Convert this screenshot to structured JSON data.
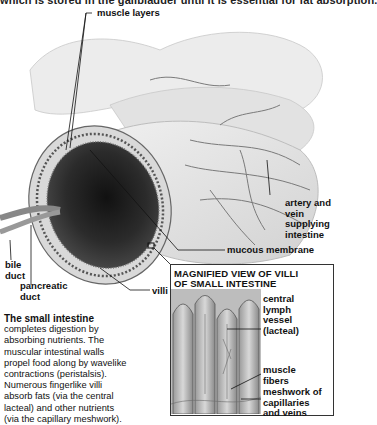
{
  "top_text": "which is stored in the gallbladder until it is essential for fat absorption.",
  "labels": {
    "muscle_layers": "muscle layers",
    "artery_vein": [
      "artery and",
      "vein",
      "supplying",
      "intestine"
    ],
    "mucous_membrane": "mucous membrane",
    "bile_duct": [
      "bile",
      "duct"
    ],
    "pancreatic_duct": [
      "pancreatic",
      "duct"
    ],
    "villi": "villi"
  },
  "inset": {
    "title_line1": "MAGNIFIED VIEW OF VILLI",
    "title_line2": "OF SMALL INTESTINE",
    "labels": {
      "lacteal": [
        "central",
        "lymph",
        "vessel",
        "(lacteal)"
      ],
      "muscle_fibers": [
        "muscle",
        "fibers"
      ],
      "meshwork": [
        "meshwork of",
        "capillaries",
        "and veins"
      ]
    }
  },
  "description": {
    "heading": "The small intestine",
    "lines": [
      "completes digestion by",
      "absorbing nutrients. The",
      "muscular intestinal walls",
      "propel food along by wavelike",
      "contractions (peristalsis).",
      "Numerous fingerlike villi",
      "absorb fats (via the central",
      "lacteal) and other nutrients",
      "(via the capillary meshwork)."
    ]
  },
  "colors": {
    "background": "#ffffff",
    "text": "#111111",
    "illustration_light": "#e6e6e6",
    "illustration_dark": "#2a2a2a"
  }
}
